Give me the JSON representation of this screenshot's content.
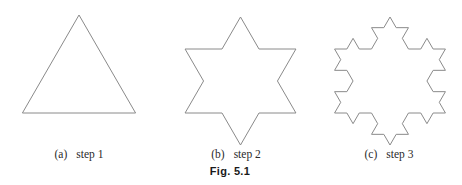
{
  "figure": {
    "label": "Fig. 5.1",
    "panels": [
      {
        "tag": "(a)",
        "caption": "step 1",
        "iterations": 0
      },
      {
        "tag": "(b)",
        "caption": "step 2",
        "iterations": 1
      },
      {
        "tag": "(c)",
        "caption": "step 3",
        "iterations": 2
      }
    ],
    "stroke_color": "#8a8a8a"
  }
}
